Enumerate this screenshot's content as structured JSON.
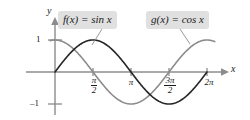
{
  "figure": {
    "background_color": "#ffffff",
    "width": 250,
    "height": 120
  },
  "axes": {
    "x_axis_label": "x",
    "y_axis_label": "y",
    "origin_px": {
      "x": 55,
      "y": 72
    },
    "amplitude_px": 32,
    "half_pi_px": 38,
    "axis_color": "#8c8c8c",
    "x_ticks": [
      {
        "name": "pi-over-2",
        "value": 1.5708,
        "numerator": "π",
        "denominator": "2",
        "is_fraction": true,
        "label": "π/2",
        "x_px": 93
      },
      {
        "name": "pi",
        "value": 3.1416,
        "numerator": "π",
        "denominator": "",
        "is_fraction": false,
        "label": "π",
        "x_px": 131
      },
      {
        "name": "3pi-over-2",
        "value": 4.7124,
        "numerator": "3π",
        "denominator": "2",
        "is_fraction": true,
        "label": "3π/2",
        "x_px": 169
      },
      {
        "name": "2pi",
        "value": 6.2832,
        "numerator": "2π",
        "denominator": "",
        "is_fraction": false,
        "label": "2π",
        "x_px": 207
      }
    ],
    "y_ticks": [
      {
        "name": "one",
        "value": 1,
        "label": "1",
        "y_px": 40
      },
      {
        "name": "negative-one",
        "value": -1,
        "label": "–1",
        "y_px": 104
      }
    ]
  },
  "callouts": {
    "f": {
      "label": "f(x) = sin x",
      "background_color": "#e0e0e0",
      "text_color": "#1a1a1a"
    },
    "g": {
      "label": "g(x) = cos x",
      "background_color": "#e0e0e0",
      "text_color": "#1a1a1a"
    }
  },
  "chart_data": {
    "type": "line",
    "title": "",
    "xlabel": "x",
    "ylabel": "y",
    "xlim": [
      -0.35,
      7.2
    ],
    "ylim": [
      -1.35,
      1.45
    ],
    "grid": false,
    "legend": "callout-labels",
    "x_tick_values": [
      1.5708,
      3.1416,
      4.7124,
      6.2832
    ],
    "x_tick_labels": [
      "π/2",
      "π",
      "3π/2",
      "2π"
    ],
    "y_tick_values": [
      1,
      -1
    ],
    "y_tick_labels": [
      "1",
      "–1"
    ],
    "series": [
      {
        "name": "f(x) = sin x",
        "expression": "sin(x)",
        "color": "#262626",
        "line_width": 1.6,
        "domain": [
          0,
          6.2832
        ],
        "x": [
          0,
          0.3927,
          0.7854,
          1.1781,
          1.5708,
          1.9635,
          2.3562,
          2.7489,
          3.1416,
          3.5343,
          3.927,
          4.3197,
          4.7124,
          5.1051,
          5.4978,
          5.8905,
          6.2832
        ],
        "values": [
          0,
          0.383,
          0.707,
          0.924,
          1,
          0.924,
          0.707,
          0.383,
          0,
          -0.383,
          -0.707,
          -0.924,
          -1,
          -0.924,
          -0.707,
          -0.383,
          0
        ]
      },
      {
        "name": "g(x) = cos x",
        "expression": "cos(x)",
        "color": "#8c8c8c",
        "line_width": 1.6,
        "domain": [
          -0.2,
          6.6
        ],
        "x": [
          0,
          0.3927,
          0.7854,
          1.1781,
          1.5708,
          1.9635,
          2.3562,
          2.7489,
          3.1416,
          3.5343,
          3.927,
          4.3197,
          4.7124,
          5.1051,
          5.4978,
          5.8905,
          6.2832
        ],
        "values": [
          1,
          0.924,
          0.707,
          0.383,
          0,
          -0.383,
          -0.707,
          -0.924,
          -1,
          -0.924,
          -0.707,
          -0.383,
          0,
          0.383,
          0.707,
          0.924,
          1
        ]
      }
    ],
    "annotations": [
      {
        "name": "f-callout",
        "text": "f(x) = sin x",
        "points_to_series": "f(x) = sin x"
      },
      {
        "name": "g-callout",
        "text": "g(x) = cos x",
        "points_to_series": "g(x) = cos x"
      }
    ]
  }
}
